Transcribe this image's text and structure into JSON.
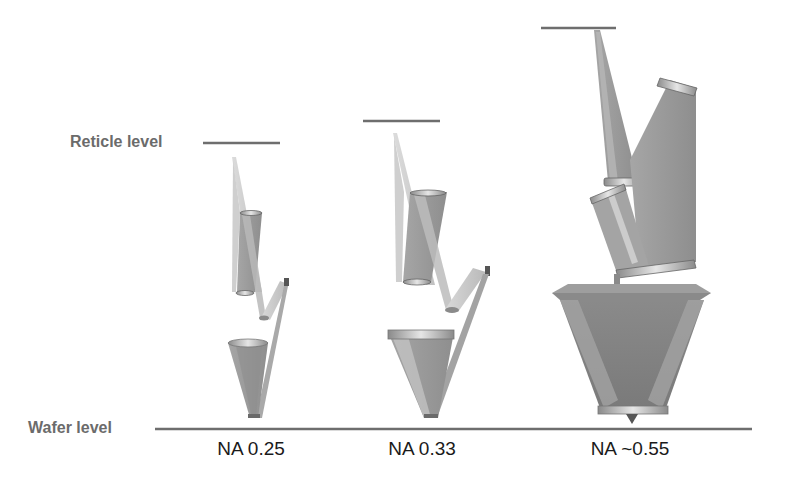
{
  "diagram": {
    "title": "",
    "levels": {
      "reticle_label": "Reticle level",
      "wafer_label": "Wafer level"
    },
    "systems": [
      {
        "id": "na025",
        "label": "NA 0.25"
      },
      {
        "id": "na033",
        "label": "NA 0.33"
      },
      {
        "id": "na055",
        "label": "NA ~0.55"
      }
    ],
    "colors": {
      "beam_light": "#c9c9c9",
      "beam_mid": "#9a9a9a",
      "beam_dark": "#7f7f7f",
      "level_line": "#6e6e6e",
      "label_gray": "#6b6b6b",
      "na_text": "#1a1a1a"
    }
  }
}
